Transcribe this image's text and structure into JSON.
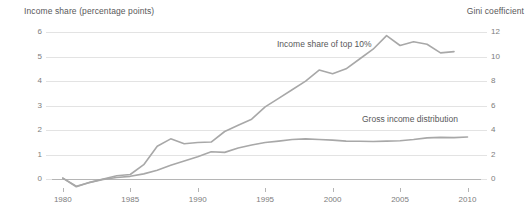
{
  "chart_data": {
    "type": "line",
    "title": "",
    "xlabel": "",
    "ylabel": "Income share (percentage points)",
    "y2label": "Gini coefficient",
    "grid": true,
    "legend_position": "inline-annotations",
    "xlim": [
      1979.2,
      2011.0
    ],
    "ylim": [
      -0.35,
      6.0
    ],
    "y2lim": [
      -0.7,
      12.0
    ],
    "xticks": [
      1980,
      1985,
      1990,
      1995,
      2000,
      2005,
      2010
    ],
    "xticklabels": [
      "1980",
      "1985",
      "1990",
      "1995",
      "2000",
      "2005",
      "2010"
    ],
    "yticks": [
      0,
      1,
      2,
      3,
      4,
      5,
      6
    ],
    "yticklabels": [
      "0",
      "1",
      "2",
      "3",
      "4",
      "5",
      "6"
    ],
    "y2ticks": [
      0,
      2,
      4,
      6,
      8,
      10,
      12
    ],
    "y2ticklabels": [
      "0",
      "2",
      "4",
      "6",
      "8",
      "10",
      "12"
    ],
    "line_color": "#a8a8a8",
    "grid_color": "#e3e3e3",
    "axis_color": "#b5b5b5",
    "series": [
      {
        "name": "Income share of top 10%",
        "axis": "left",
        "x": [
          1980,
          1981,
          1982,
          1983,
          1984,
          1985,
          1986,
          1987,
          1988,
          1989,
          1990,
          1991,
          1992,
          1993,
          1994,
          1995,
          1996,
          1997,
          1998,
          1999,
          2000,
          2001,
          2002,
          2003,
          2004,
          2005,
          2006,
          2007,
          2008,
          2009
        ],
        "values": [
          0.05,
          -0.3,
          -0.12,
          0.02,
          0.15,
          0.2,
          0.6,
          1.35,
          1.65,
          1.45,
          1.5,
          1.52,
          1.95,
          2.2,
          2.45,
          2.95,
          3.3,
          3.65,
          4.0,
          4.45,
          4.3,
          4.5,
          4.9,
          5.3,
          5.85,
          5.45,
          5.6,
          5.5,
          5.15,
          5.2
        ]
      },
      {
        "name": "Gross income distribution",
        "axis": "right",
        "x": [
          1980,
          1981,
          1982,
          1983,
          1984,
          1985,
          1986,
          1987,
          1988,
          1989,
          1990,
          1991,
          1992,
          1993,
          1994,
          1995,
          1996,
          1997,
          1998,
          1999,
          2000,
          2001,
          2002,
          2003,
          2004,
          2005,
          2006,
          2007,
          2008,
          2009,
          2010
        ],
        "values": [
          0.1,
          -0.55,
          -0.25,
          0.0,
          0.15,
          0.25,
          0.45,
          0.75,
          1.15,
          1.5,
          1.85,
          2.25,
          2.2,
          2.55,
          2.8,
          3.0,
          3.12,
          3.25,
          3.3,
          3.25,
          3.2,
          3.12,
          3.1,
          3.08,
          3.12,
          3.15,
          3.25,
          3.38,
          3.42,
          3.4,
          3.45
        ]
      }
    ],
    "annotations": [
      {
        "text": "Income share of top 10%",
        "x_px": 277,
        "y_px": 39
      },
      {
        "text": "Gross income distribution",
        "x_px": 362,
        "y_px": 114
      }
    ]
  },
  "geometry": {
    "plot_left": 52,
    "plot_right": 481,
    "plot_top": 32,
    "plot_bottom": 188
  }
}
